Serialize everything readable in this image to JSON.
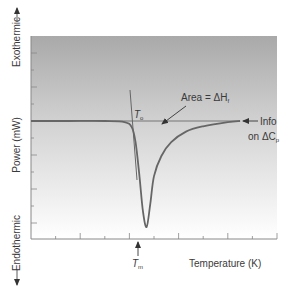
{
  "chart_data": {
    "type": "line",
    "title": "",
    "xlabel": "Temperature (K)",
    "ylabel": "Power (mW)",
    "y_direction_labels": {
      "top": "Exothermic",
      "bottom": "Endothermic"
    },
    "grid": false,
    "background": {
      "gradient_top": "#a9a9a9",
      "gradient_bottom": "#ffffff"
    },
    "curve_color": "#666666",
    "axis_ticks": {
      "x_count": 10,
      "y_count": 11
    },
    "series": [
      {
        "name": "DSC thermogram",
        "description": "flat baseline with a single sharp endothermic peak",
        "x": [
          0.0,
          0.15,
          0.3,
          0.38,
          0.41,
          0.425,
          0.44,
          0.455,
          0.47,
          0.485,
          0.5,
          0.53,
          0.57,
          0.63,
          0.7,
          0.8,
          0.85
        ],
        "y": [
          0.0,
          0.0,
          0.0,
          -0.01,
          -0.06,
          -0.2,
          -0.5,
          -0.85,
          -1.0,
          -0.78,
          -0.52,
          -0.33,
          -0.2,
          -0.1,
          -0.05,
          -0.01,
          0.0
        ]
      }
    ],
    "annotations": {
      "onset": {
        "symbol": "T",
        "subscript": "o"
      },
      "melting": {
        "symbol": "T",
        "subscript": "m"
      },
      "area": {
        "text": "Area = ΔH",
        "subscript": "f"
      },
      "info_line1": "Info",
      "info_line2": "on ΔC",
      "info_subscript": "p"
    }
  }
}
